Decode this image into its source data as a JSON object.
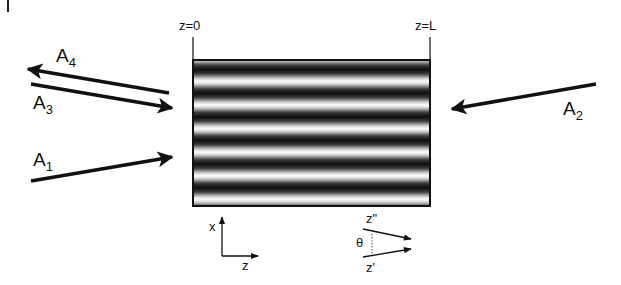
{
  "figure": {
    "type": "four-wave mixing / grating geometry schematic",
    "medium": {
      "description": "horizontal interference grating fringes",
      "left_boundary_label": "z=0",
      "right_boundary_label": "z=L",
      "fringe_count": 6,
      "colors": {
        "dark": "#111111",
        "light": "#ffffff",
        "border": "#222222"
      }
    },
    "beams": [
      {
        "id": "A1",
        "letter": "A",
        "subscript": "1",
        "direction": "incident from left, upward"
      },
      {
        "id": "A2",
        "letter": "A",
        "subscript": "2",
        "direction": "incident from right, downward-left"
      },
      {
        "id": "A3",
        "letter": "A",
        "subscript": "3",
        "direction": "incident from left, downward"
      },
      {
        "id": "A4",
        "letter": "A",
        "subscript": "4",
        "direction": "outgoing to left"
      }
    ],
    "axes": {
      "vertical": "x",
      "horizontal": "z"
    },
    "angle_inset": {
      "upper": "z\"",
      "lower": "z'",
      "angle": "θ"
    }
  }
}
